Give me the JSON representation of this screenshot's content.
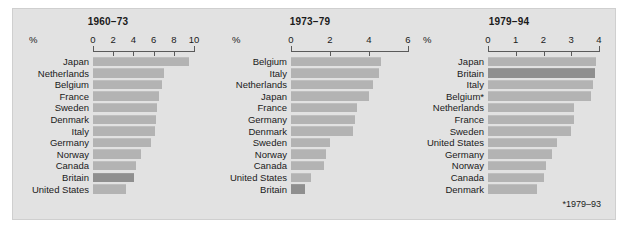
{
  "figure": {
    "footnote": "*1979–93",
    "percent_symbol": "%",
    "highlight_country": "Britain",
    "colors": {
      "background": "#ffffff",
      "plate": "#e2e2e2",
      "plate_border": "#cfcfcf",
      "bar": "#b3b3b3",
      "bar_highlight": "#8f8f8f",
      "axis": "#5a5a5a",
      "text": "#1a1a1a"
    }
  },
  "chart_data": [
    {
      "type": "bar",
      "title": "1960–73",
      "orientation": "horizontal",
      "xlabel": "%",
      "ylabel": "",
      "xlim": [
        0,
        10
      ],
      "ticks": [
        0,
        2,
        4,
        6,
        8,
        10
      ],
      "tick_labels": [
        "0",
        "2",
        "4",
        "6",
        "8",
        "10"
      ],
      "grid": false,
      "legend": "none",
      "categories": [
        "Japan",
        "Netherlands",
        "Belgium",
        "France",
        "Sweden",
        "Denmark",
        "Italy",
        "Germany",
        "Norway",
        "Canada",
        "Britain",
        "United States"
      ],
      "values": [
        9.5,
        7.0,
        6.8,
        6.5,
        6.3,
        6.2,
        6.1,
        5.7,
        4.8,
        4.3,
        4.1,
        3.3
      ],
      "highlight": [
        "Britain"
      ]
    },
    {
      "type": "bar",
      "title": "1973–79",
      "orientation": "horizontal",
      "xlabel": "%",
      "ylabel": "",
      "xlim": [
        0,
        6
      ],
      "ticks": [
        0,
        2,
        4,
        6
      ],
      "tick_labels": [
        "0",
        "2",
        "4",
        "6"
      ],
      "grid": false,
      "legend": "none",
      "categories": [
        "Belgium",
        "Italy",
        "Netherlands",
        "Japan",
        "France",
        "Germany",
        "Denmark",
        "Sweden",
        "Norway",
        "Canada",
        "United States",
        "Britain"
      ],
      "values": [
        4.6,
        4.5,
        4.2,
        4.0,
        3.4,
        3.3,
        3.2,
        2.0,
        1.8,
        1.7,
        1.0,
        0.7
      ],
      "highlight": [
        "Britain"
      ]
    },
    {
      "type": "bar",
      "title": "1979–94",
      "orientation": "horizontal",
      "xlabel": "%",
      "ylabel": "",
      "xlim": [
        0,
        4
      ],
      "ticks": [
        0,
        1,
        2,
        3,
        4
      ],
      "tick_labels": [
        "0",
        "1",
        "2",
        "3",
        "4"
      ],
      "grid": false,
      "legend": "none",
      "categories": [
        "Japan",
        "Britain",
        "Italy",
        "Belgium*",
        "Netherlands",
        "France",
        "Sweden",
        "United States",
        "Germany",
        "Norway",
        "Canada",
        "Denmark"
      ],
      "values": [
        3.9,
        3.85,
        3.8,
        3.7,
        3.1,
        3.1,
        3.0,
        2.5,
        2.3,
        2.1,
        2.0,
        1.75
      ],
      "highlight": [
        "Britain"
      ],
      "footnote": "*1979–93"
    }
  ]
}
